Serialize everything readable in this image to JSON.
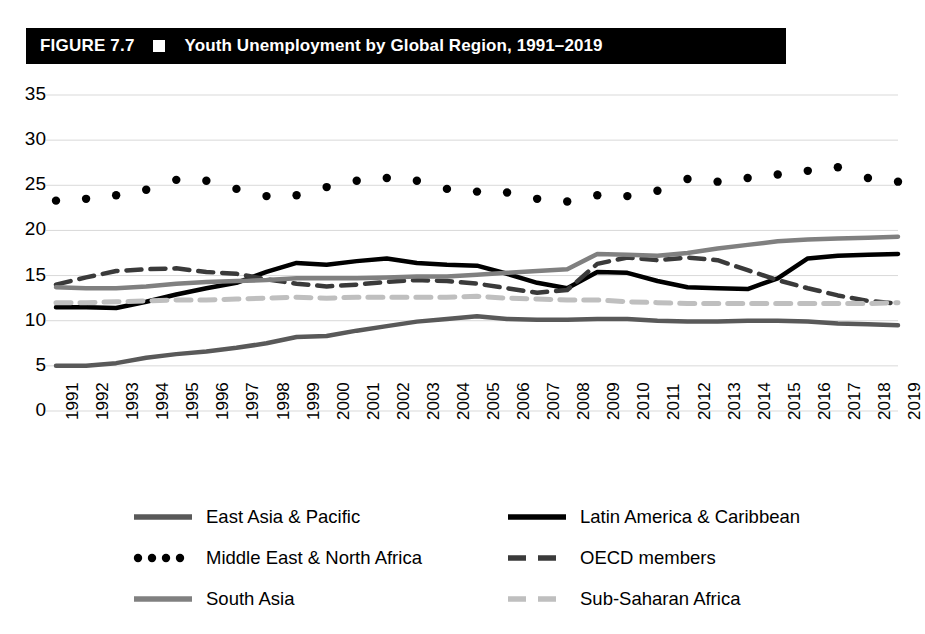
{
  "header": {
    "figure_number": "FIGURE 7.7",
    "title": "Youth Unemployment by Global Region, 1991–2019",
    "square_icon": "white-square-icon"
  },
  "chart_data": {
    "type": "line",
    "title": "Youth Unemployment by Global Region, 1991–2019",
    "xlabel": "",
    "ylabel": "",
    "ylim": [
      0,
      35
    ],
    "ytick_step": 5,
    "yticks": [
      0,
      5,
      10,
      15,
      20,
      25,
      30,
      35
    ],
    "ytick_labels": [
      "0",
      "5",
      "10",
      "15",
      "20",
      "25",
      "30",
      "35"
    ],
    "grid": true,
    "legend_position": "bottom",
    "categories": [
      "1991",
      "1992",
      "1993",
      "1994",
      "1995",
      "1996",
      "1997",
      "1998",
      "1999",
      "2000",
      "2001",
      "2002",
      "2003",
      "2004",
      "2005",
      "2006",
      "2007",
      "2008",
      "2009",
      "2010",
      "2011",
      "2012",
      "2013",
      "2014",
      "2015",
      "2016",
      "2017",
      "2018",
      "2019"
    ],
    "series": [
      {
        "name": "East Asia & Pacific",
        "style": "solid",
        "color": "#595959",
        "width": 4.5,
        "values": [
          5.0,
          5.0,
          5.3,
          5.9,
          6.3,
          6.6,
          7.0,
          7.5,
          8.2,
          8.3,
          8.9,
          9.4,
          9.9,
          10.2,
          10.5,
          10.2,
          10.1,
          10.1,
          10.2,
          10.2,
          10.0,
          9.9,
          9.9,
          10.0,
          10.0,
          9.9,
          9.7,
          9.6,
          9.5
        ]
      },
      {
        "name": "Latin America & Caribbean",
        "style": "solid",
        "color": "#000000",
        "width": 4.5,
        "values": [
          11.5,
          11.5,
          11.4,
          12.1,
          12.9,
          13.6,
          14.2,
          15.4,
          16.4,
          16.2,
          16.6,
          16.9,
          16.4,
          16.2,
          16.1,
          15.2,
          14.2,
          13.6,
          15.4,
          15.3,
          14.4,
          13.7,
          13.6,
          13.5,
          14.7,
          16.9,
          17.2,
          17.3,
          17.4
        ]
      },
      {
        "name": "Middle East & North Africa",
        "style": "dotted",
        "color": "#000000",
        "width": 5.5,
        "values": [
          23.3,
          23.5,
          23.9,
          24.5,
          25.6,
          25.5,
          24.6,
          23.8,
          23.9,
          24.8,
          25.5,
          25.8,
          25.5,
          24.6,
          24.3,
          24.2,
          23.5,
          23.2,
          23.9,
          23.8,
          24.4,
          25.7,
          25.4,
          25.8,
          26.2,
          26.6,
          27.0,
          25.8,
          25.4
        ]
      },
      {
        "name": "OECD members",
        "style": "dashed",
        "color": "#3a3a3a",
        "width": 4.5,
        "values": [
          14.0,
          14.8,
          15.5,
          15.7,
          15.8,
          15.4,
          15.2,
          14.6,
          14.1,
          13.8,
          14.0,
          14.3,
          14.5,
          14.4,
          14.1,
          13.6,
          13.1,
          13.4,
          16.3,
          17.0,
          16.7,
          17.0,
          16.7,
          15.6,
          14.5,
          13.6,
          12.8,
          12.2,
          11.9
        ]
      },
      {
        "name": "South Asia",
        "style": "solid",
        "color": "#808080",
        "width": 4.5,
        "values": [
          13.7,
          13.6,
          13.6,
          13.8,
          14.1,
          14.3,
          14.4,
          14.5,
          14.7,
          14.7,
          14.7,
          14.8,
          14.9,
          14.9,
          15.1,
          15.3,
          15.5,
          15.7,
          17.4,
          17.3,
          17.2,
          17.5,
          18.0,
          18.4,
          18.8,
          19.0,
          19.1,
          19.2,
          19.3
        ]
      },
      {
        "name": "Sub-Saharan Africa",
        "style": "dashed",
        "color": "#bfbfbf",
        "width": 5.0,
        "values": [
          12.0,
          12.0,
          12.1,
          12.2,
          12.3,
          12.3,
          12.4,
          12.5,
          12.6,
          12.5,
          12.6,
          12.6,
          12.6,
          12.6,
          12.7,
          12.5,
          12.4,
          12.3,
          12.3,
          12.1,
          12.0,
          11.9,
          11.9,
          11.9,
          11.9,
          11.9,
          11.9,
          11.9,
          12.0
        ]
      }
    ]
  },
  "legend": {
    "items": [
      {
        "label": "East Asia & Pacific",
        "color": "#595959",
        "style": "solid"
      },
      {
        "label": "Latin America & Caribbean",
        "color": "#000000",
        "style": "solid"
      },
      {
        "label": "Middle East & North Africa",
        "color": "#000000",
        "style": "dotted"
      },
      {
        "label": "OECD members",
        "color": "#3a3a3a",
        "style": "dashed"
      },
      {
        "label": "South Asia",
        "color": "#808080",
        "style": "solid"
      },
      {
        "label": "Sub-Saharan Africa",
        "color": "#bfbfbf",
        "style": "dashed"
      }
    ]
  }
}
